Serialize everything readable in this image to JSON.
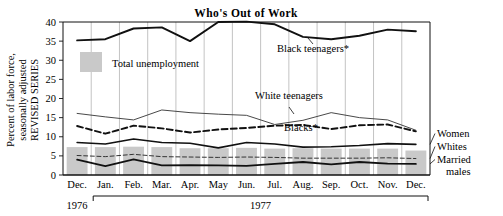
{
  "chart_data": {
    "type": "line",
    "title": "Who's Out of Work",
    "ylabel_line1": "Percent of labor force,",
    "ylabel_line2": "seasonally adjusted",
    "ylabel_line3": "REVISED SERIES",
    "xlabel": "",
    "ylim": [
      0,
      40
    ],
    "yticks": [
      0,
      5,
      10,
      15,
      20,
      25,
      30,
      35,
      40
    ],
    "ytick_labels": [
      "0",
      "5",
      "10",
      "15",
      "20",
      "25",
      "30",
      "35",
      "40"
    ],
    "grid": true,
    "legend_position": "inside-upper-left",
    "categories": [
      "Dec.",
      "Jan.",
      "Feb.",
      "Mar.",
      "Apr.",
      "May",
      "Jun.",
      "Jul.",
      "Aug.",
      "Sep.",
      "Oct.",
      "Nov.",
      "Dec."
    ],
    "year_groups": [
      {
        "label": "1976",
        "start": 0,
        "end": 0,
        "bracket": false
      },
      {
        "label": "1977",
        "start": 1,
        "end": 12,
        "bracket": true
      }
    ],
    "bars": {
      "name": "Total unemployment",
      "legend_label": "Total unemployment",
      "color": "#c9c9c9",
      "values": [
        7.3,
        7.3,
        7.4,
        7.3,
        7.0,
        7.0,
        7.1,
        6.9,
        7.0,
        6.9,
        6.9,
        6.9,
        6.4
      ]
    },
    "series": [
      {
        "name": "Black teenagers*",
        "label": "Black teenagers*",
        "style": "solid",
        "width": 1.9,
        "color": "#111111",
        "values": [
          35.2,
          35.5,
          38.3,
          38.6,
          35.0,
          40.0,
          40.1,
          39.4,
          36.1,
          35.5,
          36.4,
          38.0,
          37.6
        ]
      },
      {
        "name": "White teenagers",
        "label": "White teenagers",
        "style": "solid",
        "width": 0.9,
        "color": "#333333",
        "values": [
          16.1,
          15.2,
          14.4,
          17.0,
          16.3,
          15.9,
          15.6,
          13.2,
          14.3,
          16.3,
          15.0,
          14.4,
          11.7
        ]
      },
      {
        "name": "Blacks*",
        "label": "Blacks*",
        "style": "dashed",
        "width": 1.9,
        "color": "#111111",
        "values": [
          12.8,
          10.8,
          12.9,
          12.2,
          11.1,
          11.9,
          12.3,
          12.9,
          13.1,
          12.0,
          13.0,
          13.2,
          11.4
        ]
      },
      {
        "name": "Women",
        "label": "Women",
        "style": "solid",
        "width": 1.6,
        "color": "#111111",
        "values": [
          8.5,
          8.1,
          9.4,
          8.5,
          8.3,
          7.1,
          8.5,
          8.1,
          7.3,
          7.4,
          7.7,
          8.2,
          8.0
        ]
      },
      {
        "name": "Whites",
        "label": "Whites",
        "style": "dashed",
        "width": 1.0,
        "color": "#333333",
        "values": [
          5.1,
          4.8,
          5.4,
          4.8,
          4.7,
          4.6,
          4.7,
          4.6,
          4.4,
          4.4,
          4.4,
          4.5,
          4.3
        ]
      },
      {
        "name": "Married males",
        "label": "Married males",
        "label_line1": "Married",
        "label_line2": "males",
        "style": "solid",
        "width": 1.8,
        "color": "#111111",
        "values": [
          4.0,
          2.3,
          4.1,
          2.5,
          2.6,
          2.5,
          2.4,
          2.9,
          3.4,
          2.8,
          3.4,
          3.0,
          2.9
        ]
      }
    ],
    "inline_annotations": [
      {
        "text": "Black teenagers*",
        "x_px": 313,
        "y_px": 52
      },
      {
        "text": "White teenagers",
        "x_px": 289,
        "y_px": 99
      },
      {
        "text": "Blacks*",
        "x_px": 301,
        "y_px": 131
      }
    ],
    "right_labels": [
      "Women",
      "Whites",
      "Married",
      "males"
    ],
    "footnote_marker": "*"
  }
}
